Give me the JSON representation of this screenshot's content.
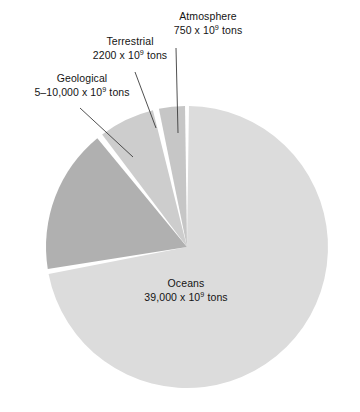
{
  "chart_data": {
    "type": "pie",
    "title": "",
    "subtitle": "",
    "xlabel": "",
    "ylabel": "",
    "legend_position": "none",
    "grid": false,
    "units": "x 10^9 tons",
    "categories": [
      "Atmosphere",
      "Terrestrial",
      "Geological",
      "Oceans"
    ],
    "values": [
      750,
      2200,
      7500,
      39000
    ],
    "value_labels": [
      "750 x 10⁹ tons",
      "2200 x 10⁹ tons",
      "5–10,000 x 10⁹ tons",
      "39,000 x 10⁹ tons"
    ],
    "colors": [
      "#c6c6c6",
      "#cdcdcd",
      "#b0b0b0",
      "#dcdcdc"
    ],
    "slices": [
      {
        "name": "Atmosphere",
        "label_line1": "Atmosphere",
        "label_line2_prefix": "750 x 10",
        "label_exponent": "9",
        "label_line2_suffix": " tons",
        "value": 750,
        "value_text": "750",
        "color": "#c6c6c6",
        "start_angle_deg": 348.5,
        "end_angle_deg": 359.2
      },
      {
        "name": "Terrestrial",
        "label_line1": "Terrestrial",
        "label_line2_prefix": "2200 x 10",
        "label_exponent": "9",
        "label_line2_suffix": " tons",
        "value": 2200,
        "value_text": "2200",
        "color": "#cdcdcd",
        "start_angle_deg": 323.0,
        "end_angle_deg": 346.0
      },
      {
        "name": "Geological",
        "label_line1": "Geological",
        "label_line2_prefix": "5–10,000 x 10",
        "label_exponent": "9",
        "label_line2_suffix": " tons",
        "value": 7500,
        "value_text": "5–10,000",
        "color": "#b0b0b0",
        "start_angle_deg": 261.0,
        "end_angle_deg": 320.5
      },
      {
        "name": "Oceans",
        "label_line1": "Oceans",
        "label_line2_prefix": "39,000 x 10",
        "label_exponent": "9",
        "label_line2_suffix": " tons",
        "value": 39000,
        "value_text": "39,000",
        "color": "#dcdcdc",
        "start_angle_deg": 0.8,
        "end_angle_deg": 259.0
      }
    ]
  },
  "figure": {
    "background_color": "#ffffff",
    "text_color": "#141414",
    "leader_line_color": "#3c3c3c",
    "center_x": 187,
    "center_y": 247,
    "radius": 141
  },
  "labels": {
    "geological": {
      "line1": "Geological",
      "line2_prefix": "5–10,000 x 10",
      "exponent": "9",
      "line2_suffix": " tons"
    },
    "terrestrial": {
      "line1": "Terrestrial",
      "line2_prefix": "2200 x 10",
      "exponent": "9",
      "line2_suffix": " tons"
    },
    "atmosphere": {
      "line1": "Atmosphere",
      "line2_prefix": "750 x 10",
      "exponent": "9",
      "line2_suffix": " tons"
    },
    "oceans": {
      "line1": "Oceans",
      "line2_prefix": "39,000 x 10",
      "exponent": "9",
      "line2_suffix": " tons"
    }
  }
}
